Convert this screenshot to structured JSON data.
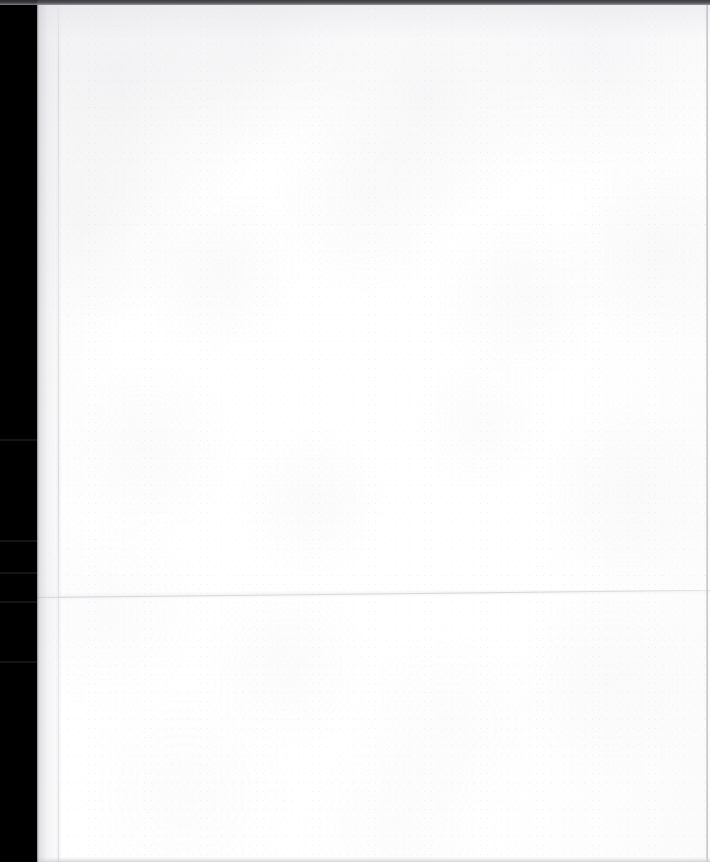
{
  "document": {
    "kind": "scanned-page",
    "page_state": "blank",
    "visible_text": "",
    "width_px": 710,
    "height_px": 862
  },
  "page": {
    "background_color": "#ffffff",
    "paper_color": "#fcfcfd",
    "body_text": ""
  },
  "artifacts": {
    "gutter": {
      "label": "scanner binding gutter",
      "color": "#000000",
      "left_px": 0,
      "width_px": 37,
      "seam_color": "#141414",
      "seams_y_px": [
        440,
        541,
        573,
        602,
        662
      ]
    },
    "top_band": {
      "label": "top scan edge band",
      "color": "#2b2b2e",
      "height_px": 5
    },
    "vertical_crease": {
      "label": "vertical fold crease",
      "color": "#cdcdd4",
      "x_px": 58
    },
    "horizontal_fold": {
      "label": "horizontal fold crease",
      "color": "#c7c7ce",
      "y_px": 597,
      "slope_deg": -0.62
    },
    "right_border": {
      "label": "page right edge",
      "color": "#b0b0b8",
      "x_px": 706
    },
    "bottom_border": {
      "label": "page bottom edge",
      "color": "#c6c6ce",
      "y_px": 859
    }
  }
}
